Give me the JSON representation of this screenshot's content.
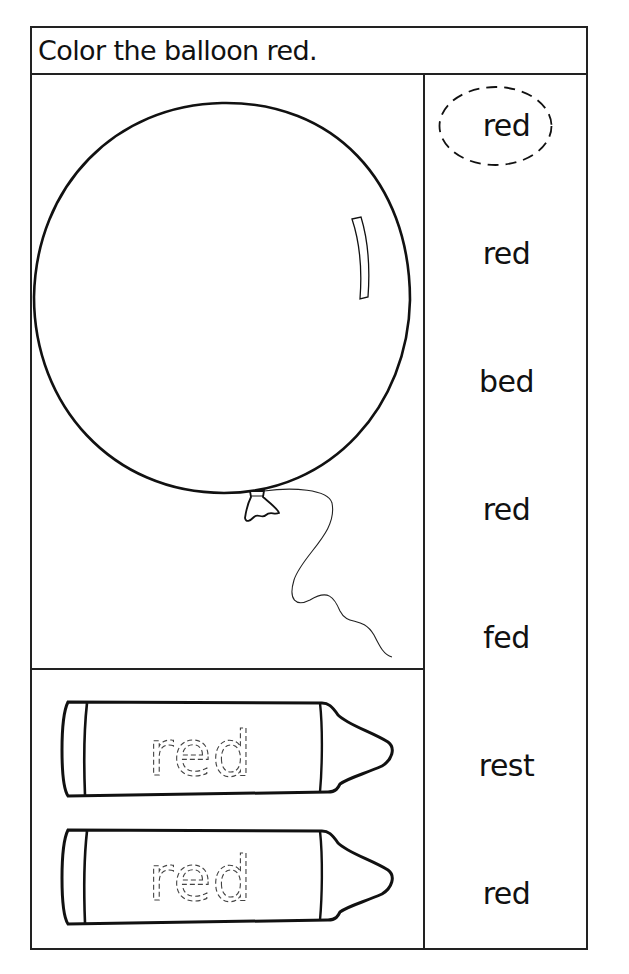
{
  "worksheet": {
    "instruction": "Color the balloon red.",
    "target_word": "red",
    "picture": {
      "subject": "balloon-illustration"
    },
    "crayons": [
      {
        "traced_word": "red"
      },
      {
        "traced_word": "red"
      }
    ],
    "word_list": [
      {
        "word": "red",
        "circled": true
      },
      {
        "word": "red",
        "circled": false
      },
      {
        "word": "bed",
        "circled": false
      },
      {
        "word": "red",
        "circled": false
      },
      {
        "word": "fed",
        "circled": false
      },
      {
        "word": "rest",
        "circled": false
      },
      {
        "word": "red",
        "circled": false
      }
    ]
  },
  "colors": {
    "ink": "#111111",
    "background": "#ffffff",
    "trace": "#444444"
  }
}
